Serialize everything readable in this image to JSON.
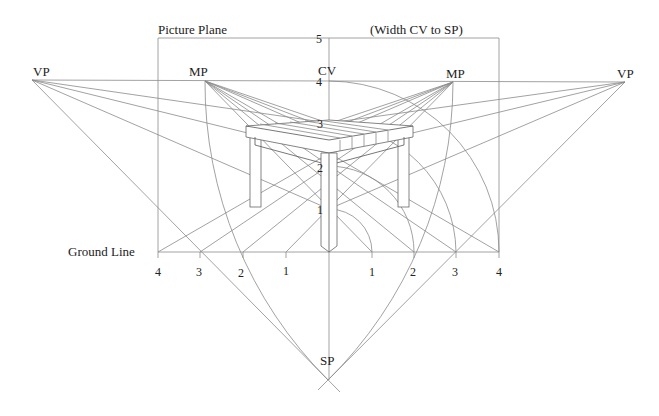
{
  "diagram": {
    "title_labels": {
      "picture_plane": "Picture Plane",
      "width_note": "(Width CV to SP)",
      "ground_line": "Ground Line",
      "cv": "CV",
      "sp": "SP",
      "vp_left": "VP",
      "vp_right": "VP",
      "mp_left": "MP",
      "mp_right": "MP"
    },
    "vertical_scale": [
      "1",
      "2",
      "3",
      "4",
      "5"
    ],
    "ground_scale_left": [
      "1",
      "2",
      "3",
      "4"
    ],
    "ground_scale_right": [
      "1",
      "2",
      "3",
      "4"
    ],
    "points": {
      "vp_left": [
        32,
        80
      ],
      "vp_right": [
        625,
        82
      ],
      "mp_left": [
        205,
        81
      ],
      "mp_right": [
        453,
        82
      ],
      "cv": [
        329,
        81
      ],
      "sp": [
        328,
        380
      ],
      "ground_line_y": 252,
      "picture_plane_rect": [
        158,
        38,
        499,
        252
      ],
      "unit": 43
    },
    "colors": {
      "line": "#8a8a8a",
      "text": "#222222",
      "background": "#ffffff"
    }
  }
}
